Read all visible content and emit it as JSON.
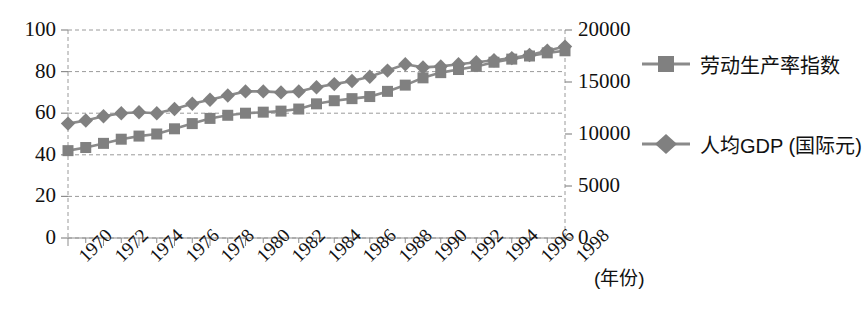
{
  "chart_data": {
    "type": "line",
    "title": "",
    "subtitle": "",
    "xlabel": "(年份)",
    "ylabel": "",
    "y2label": "",
    "grid": true,
    "legend_position": "right",
    "marker_color": "#808080",
    "line_color": "#8a8a8a",
    "axis_color": "#8d8d8d",
    "grid_color": "#9a9a9a",
    "x": [
      1970,
      1971,
      1972,
      1973,
      1974,
      1975,
      1976,
      1977,
      1978,
      1979,
      1980,
      1981,
      1982,
      1983,
      1984,
      1985,
      1986,
      1987,
      1988,
      1989,
      1990,
      1991,
      1992,
      1993,
      1994,
      1995,
      1996,
      1997,
      1998
    ],
    "xtick_labels": [
      "1970",
      "1972",
      "1974",
      "1976",
      "1978",
      "1980",
      "1982",
      "1984",
      "1986",
      "1988",
      "1990",
      "1992",
      "1994",
      "1996",
      "1998"
    ],
    "xtick_values": [
      1970,
      1972,
      1974,
      1976,
      1978,
      1980,
      1982,
      1984,
      1986,
      1988,
      1990,
      1992,
      1994,
      1996,
      1998
    ],
    "xlim": [
      1970,
      1998
    ],
    "ylim": [
      0,
      100
    ],
    "ytick_labels": [
      "0",
      "20",
      "40",
      "60",
      "80",
      "100"
    ],
    "ytick_values": [
      0,
      20,
      40,
      60,
      80,
      100
    ],
    "y2lim": [
      0,
      20000
    ],
    "y2tick_labels": [
      "0",
      "5000",
      "10000",
      "15000",
      "20000"
    ],
    "y2tick_values": [
      0,
      5000,
      10000,
      15000,
      20000
    ],
    "series": [
      {
        "name": "劳动生产率指数",
        "marker": "square",
        "axis": "left",
        "values": [
          42,
          43.5,
          45.5,
          47.5,
          49,
          50,
          52.5,
          55,
          57.5,
          59,
          60,
          60.5,
          61,
          62,
          64.5,
          66,
          67,
          68,
          70.5,
          73.5,
          77,
          79.5,
          81,
          82.5,
          84.5,
          86,
          87.5,
          89,
          90
        ]
      },
      {
        "name": "人均GDP (国际元)",
        "marker": "diamond",
        "axis": "right",
        "values_left_scale": [
          55,
          56.5,
          58.5,
          60,
          60.5,
          60,
          62,
          64.5,
          66.5,
          68.5,
          70.5,
          70.5,
          70,
          70.5,
          72.5,
          74,
          75.5,
          77.5,
          80.5,
          83.5,
          82,
          82.5,
          83.5,
          84.5,
          85.5,
          86.5,
          88,
          90,
          92
        ],
        "values": [
          11000,
          11300,
          11700,
          12000,
          12100,
          12000,
          12400,
          12900,
          13300,
          13700,
          14100,
          14100,
          14000,
          14100,
          14500,
          14800,
          15100,
          15500,
          16100,
          16700,
          16400,
          16500,
          16700,
          16900,
          17100,
          17300,
          17600,
          18000,
          18400
        ]
      }
    ]
  },
  "legend": {
    "items": [
      {
        "label": "劳动生产率指数",
        "marker": "square"
      },
      {
        "label": "人均GDP (国际元)",
        "marker": "diamond"
      }
    ]
  }
}
